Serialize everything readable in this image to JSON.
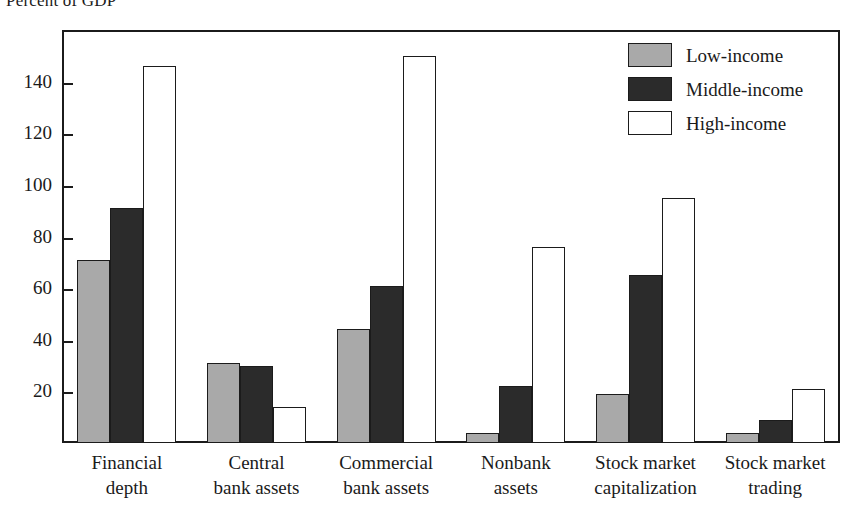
{
  "chart_data": {
    "type": "bar",
    "title": "Percent of GDP",
    "subtitle": "",
    "xlabel": "",
    "ylabel": "",
    "ylim": [
      0,
      160
    ],
    "yticks": [
      20,
      40,
      60,
      80,
      100,
      120,
      140
    ],
    "ytick_labels": [
      "20",
      "40",
      "60",
      "80",
      "100",
      "120",
      "140"
    ],
    "grid": false,
    "legend_position": "top-right",
    "categories": [
      "Financial depth",
      "Central bank assets",
      "Commercial bank assets",
      "Nonbank assets",
      "Stock market capitalization",
      "Stock market trading"
    ],
    "category_lines": [
      [
        "Financial",
        "depth"
      ],
      [
        "Central",
        "bank assets"
      ],
      [
        "Commercial",
        "bank assets"
      ],
      [
        "Nonbank",
        "assets"
      ],
      [
        "Stock market",
        "capitalization"
      ],
      [
        "Stock market",
        "trading"
      ]
    ],
    "series": [
      {
        "name": "Low-income",
        "color": "#a9a9a9",
        "values": [
          71,
          31,
          44,
          4,
          19,
          4
        ]
      },
      {
        "name": "Middle-income",
        "color": "#2b2b2b",
        "values": [
          91,
          30,
          61,
          22,
          65,
          9
        ]
      },
      {
        "name": "High-income",
        "color": "#ffffff",
        "values": [
          146,
          14,
          150,
          76,
          95,
          21
        ]
      }
    ]
  },
  "legend": {
    "items": [
      {
        "label": "Low-income",
        "swatch": "low"
      },
      {
        "label": "Middle-income",
        "swatch": "middle"
      },
      {
        "label": "High-income",
        "swatch": "high"
      }
    ]
  },
  "colors": {
    "low_income": "#a9a9a9",
    "middle_income": "#2b2b2b",
    "high_income": "#ffffff",
    "axis": "#1b1b1b",
    "background": "#ffffff"
  }
}
